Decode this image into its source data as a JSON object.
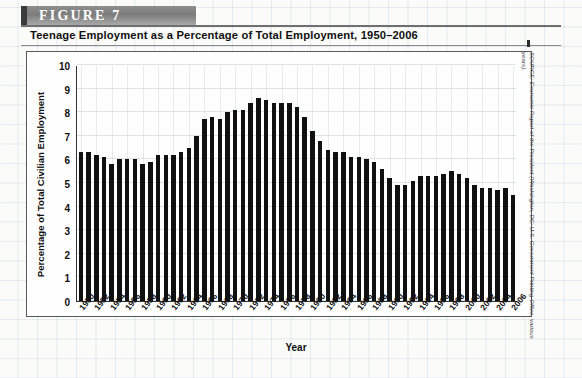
{
  "figure": {
    "badge": "FIGURE  7",
    "title": "Teenage Employment as a Percentage of Total Employment, 1950–2006",
    "source": "SOURCE: Economic Report of the President (Washington, DC: U.S. Government Printing Office, various years)."
  },
  "chart_data": {
    "type": "bar",
    "title": "Teenage Employment as a Percentage of Total Employment, 1950–2006",
    "xlabel": "Year",
    "ylabel": "Percentage of Total Civilian Employment",
    "ylim": [
      0,
      10
    ],
    "ytick_values": [
      0,
      1,
      2,
      3,
      4,
      5,
      6,
      7,
      8,
      9,
      10
    ],
    "xtick_labels": [
      "1950",
      "1952",
      "1954",
      "1956",
      "1958",
      "1960",
      "1962",
      "1964",
      "1966",
      "1968",
      "1970",
      "1972",
      "1974",
      "1976",
      "1978",
      "1980",
      "1982",
      "1984",
      "1986",
      "1988",
      "1990",
      "1992",
      "1994",
      "1996",
      "1998",
      "2000",
      "2002",
      "2004",
      "2006"
    ],
    "grid": true,
    "legend": "none",
    "bar_color": "#101010",
    "categories": [
      1950,
      1951,
      1952,
      1953,
      1954,
      1955,
      1956,
      1957,
      1958,
      1959,
      1960,
      1961,
      1962,
      1963,
      1964,
      1965,
      1966,
      1967,
      1968,
      1969,
      1970,
      1971,
      1972,
      1973,
      1974,
      1975,
      1976,
      1977,
      1978,
      1979,
      1980,
      1981,
      1982,
      1983,
      1984,
      1985,
      1986,
      1987,
      1988,
      1989,
      1990,
      1991,
      1992,
      1993,
      1994,
      1995,
      1996,
      1997,
      1998,
      1999,
      2000,
      2001,
      2002,
      2003,
      2004,
      2005,
      2006
    ],
    "values": [
      6.3,
      6.3,
      6.2,
      6.1,
      5.8,
      6.0,
      6.0,
      6.0,
      5.8,
      5.9,
      6.2,
      6.2,
      6.2,
      6.3,
      6.5,
      7.0,
      7.7,
      7.8,
      7.7,
      8.0,
      8.1,
      8.1,
      8.4,
      8.6,
      8.5,
      8.4,
      8.4,
      8.4,
      8.2,
      7.8,
      7.2,
      6.8,
      6.4,
      6.3,
      6.3,
      6.1,
      6.1,
      6.0,
      5.9,
      5.6,
      5.2,
      4.9,
      4.9,
      5.1,
      5.3,
      5.3,
      5.3,
      5.4,
      5.5,
      5.4,
      5.2,
      4.9,
      4.8,
      4.8,
      4.7,
      4.8,
      4.5
    ],
    "axis_ranges": {
      "x_start": 1950,
      "x_end": 2006,
      "y_min": 0,
      "y_max": 10
    }
  }
}
